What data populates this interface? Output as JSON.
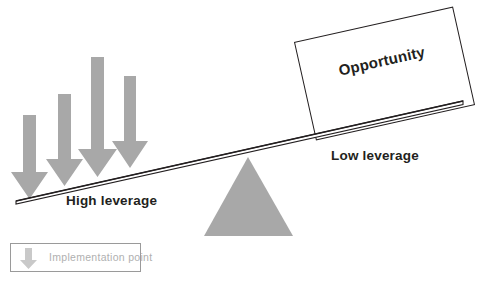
{
  "diagram": {
    "title_text": "Opportunity",
    "labels": {
      "high_leverage": "High leverage",
      "low_leverage": "Low leverage"
    },
    "legend": {
      "icon": "down-arrow-icon",
      "text": "Implementation point"
    },
    "colors": {
      "fill_gray": "#a8a8a8",
      "stroke_dark": "#231f20",
      "legend_border": "#9a9a9a",
      "legend_text": "#b0b0b0",
      "background": "#ffffff"
    },
    "lever": {
      "left_end": [
        16,
        201
      ],
      "right_end": [
        463,
        101
      ],
      "plank_thickness": 3
    },
    "fulcrum": {
      "apex": [
        248,
        157
      ],
      "base_left": [
        204,
        236
      ],
      "base_right": [
        293,
        236
      ]
    },
    "arrows": [
      {
        "name": "implementation-arrow-1",
        "shaft_left": 23,
        "shaft_width": 13,
        "top": 115,
        "tip": 199,
        "head_half_width": 12
      },
      {
        "name": "implementation-arrow-2",
        "shaft_left": 58,
        "shaft_width": 13,
        "top": 94,
        "tip": 186,
        "head_half_width": 12
      },
      {
        "name": "implementation-arrow-3",
        "shaft_left": 91,
        "shaft_width": 13,
        "top": 57,
        "tip": 177,
        "head_half_width": 13
      },
      {
        "name": "implementation-arrow-4",
        "shaft_left": 124,
        "shaft_width": 12,
        "top": 76,
        "tip": 168,
        "head_half_width": 12
      }
    ]
  }
}
